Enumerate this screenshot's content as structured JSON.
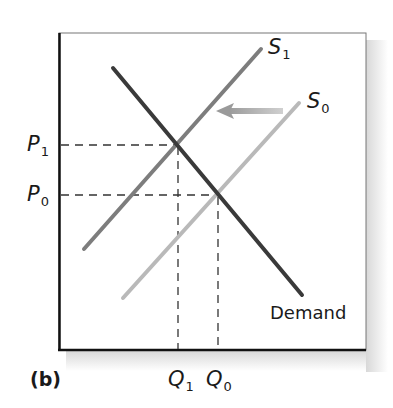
{
  "panel_label": "(b)",
  "axes": {
    "price_labels": [
      {
        "letter": "P",
        "sub": "1",
        "level": "high"
      },
      {
        "letter": "P",
        "sub": "0",
        "level": "low"
      }
    ],
    "quantity_labels": [
      {
        "letter": "Q",
        "sub": "1",
        "position": "left"
      },
      {
        "letter": "Q",
        "sub": "0",
        "position": "right"
      }
    ]
  },
  "curves": {
    "demand": {
      "label": "Demand",
      "color": "#3a3a3a"
    },
    "supply_new": {
      "letter": "S",
      "sub": "1",
      "color": "#7d7d7d"
    },
    "supply_old": {
      "letter": "S",
      "sub": "0",
      "color": "#b9b9b9"
    }
  },
  "shift_arrow": {
    "direction": "left",
    "meaning": "supply decreases from S0 to S1",
    "color": "#a8a8a8"
  },
  "equilibria": [
    {
      "name": "initial",
      "price": "P0",
      "quantity": "Q0"
    },
    {
      "name": "new",
      "price": "P1",
      "quantity": "Q1"
    }
  ]
}
